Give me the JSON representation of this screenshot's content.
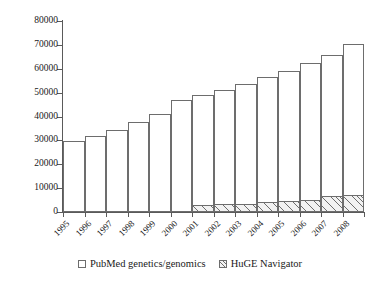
{
  "chart_data": {
    "type": "bar",
    "title": "",
    "subtitle": "",
    "xlabel": "",
    "ylabel": "",
    "stacked": true,
    "grid": false,
    "legend_position": "bottom",
    "ylim": [
      0,
      80000
    ],
    "ytick_labels": [
      "0",
      "10000",
      "20000",
      "30000",
      "40000",
      "50000",
      "60000",
      "70000",
      "80000"
    ],
    "ytick_values": [
      0,
      10000,
      20000,
      30000,
      40000,
      50000,
      60000,
      70000,
      80000
    ],
    "categories": [
      "1995",
      "1996",
      "1997",
      "1998",
      "1999",
      "2000",
      "2001",
      "2002",
      "2003",
      "2004",
      "2005",
      "2006",
      "2007",
      "2008"
    ],
    "series": [
      {
        "name": "PubMed genetics/genomics",
        "fill": "#ffffff",
        "pattern": "none",
        "values": [
          29700,
          32000,
          34300,
          37600,
          41000,
          46800,
          49000,
          51000,
          53500,
          56500,
          59000,
          62500,
          65800,
          70500
        ]
      },
      {
        "name": "HuGE Navigator",
        "fill": "#f2f2f2",
        "pattern": "diagonal-hatch",
        "values": [
          0,
          0,
          0,
          0,
          0,
          0,
          2900,
          3300,
          3500,
          4100,
          4500,
          5000,
          6800,
          7300
        ]
      }
    ]
  },
  "axes": {
    "line_color": "#5a5a5a"
  },
  "legend": {
    "entries": [
      {
        "label": "PubMed genetics/genomics",
        "swatch": "empty-square"
      },
      {
        "label": "HuGE Navigator",
        "swatch": "hatched-square"
      }
    ]
  }
}
